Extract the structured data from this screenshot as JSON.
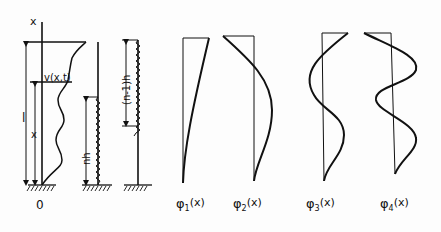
{
  "diagram": {
    "axis_label_x": "x",
    "origin_label": "0",
    "beam": {
      "length_label": "l",
      "position_label": "x",
      "deflection_label": "v(x,t)"
    },
    "discrete_model_1": {
      "label": "nh"
    },
    "discrete_model_2": {
      "label": "(n-1)h"
    },
    "modes": [
      {
        "label_phi": "φ",
        "sub": "1",
        "arg": "(x)"
      },
      {
        "label_phi": "φ",
        "sub": "2",
        "arg": "(x)"
      },
      {
        "label_phi": "φ",
        "sub": "3",
        "arg": "(x)"
      },
      {
        "label_phi": "φ",
        "sub": "4",
        "arg": "(x)"
      }
    ],
    "colors": {
      "ink": "#111111",
      "background": "#fdfdfd"
    }
  }
}
